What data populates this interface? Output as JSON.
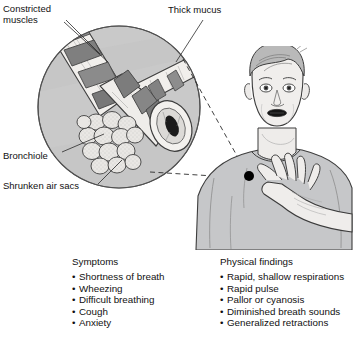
{
  "figure": {
    "labels": {
      "constricted_muscles": "Constricted\nmuscles",
      "thick_mucus": "Thick mucus",
      "bronchiole": "Bronchiole",
      "shrunken_air_sacs": "Shrunken air sacs"
    },
    "colors": {
      "inset_background": "#c9c9c9",
      "inset_outline": "#555555",
      "tissue_light": "#f2f0ee",
      "muscle_band": "#8a8a8a",
      "muscle_band_dark": "#6d6d6d",
      "lumen_dark": "#1c1c1c",
      "skin": "#efeeec",
      "shirt": "#c5c6c8",
      "outline": "#3a3a3a",
      "chest_marker": "#000000",
      "page_background": "#ffffff"
    }
  },
  "columns": {
    "symptoms": {
      "heading": "Symptoms",
      "items": [
        "Shortness of breath",
        "Wheezing",
        "Difficult breathing",
        "Cough",
        "Anxiety"
      ]
    },
    "physical_findings": {
      "heading": "Physical findings",
      "items": [
        "Rapid, shallow respirations",
        "Rapid pulse",
        "Pallor or cyanosis",
        "Diminished breath sounds",
        "Generalized retractions"
      ]
    }
  }
}
